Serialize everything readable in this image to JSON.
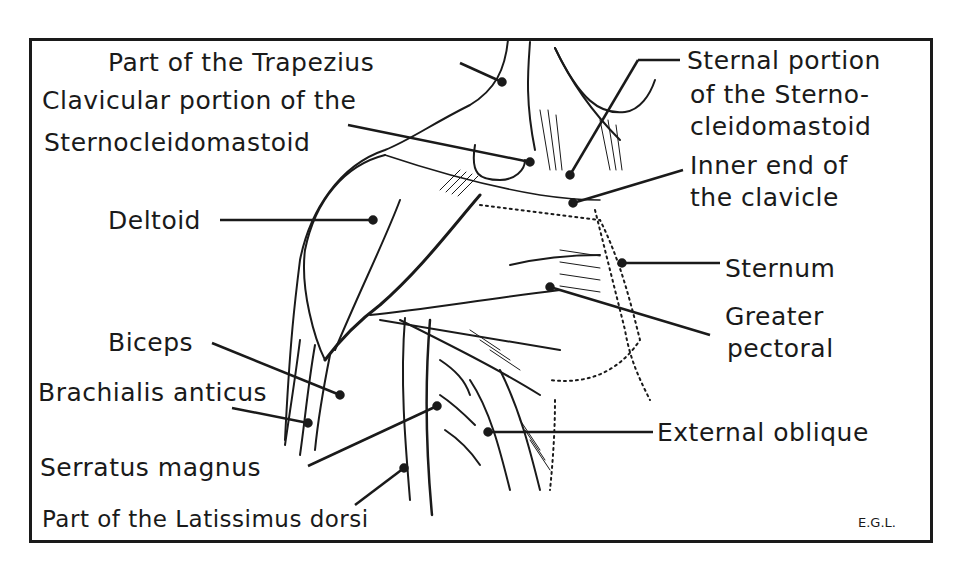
{
  "diagram": {
    "type": "anatomical-illustration",
    "labels": [
      {
        "id": "trapezius",
        "text": "Part of the Trapezius"
      },
      {
        "id": "clavicular-scm-line1",
        "text": "Clavicular portion of the"
      },
      {
        "id": "clavicular-scm-line2",
        "text": "Sternocleidomastoid"
      },
      {
        "id": "sternal-scm-line1",
        "text": "Sternal portion"
      },
      {
        "id": "sternal-scm-line2",
        "text": "of the Sterno-"
      },
      {
        "id": "sternal-scm-line3",
        "text": "cleidomastoid"
      },
      {
        "id": "inner-clavicle-line1",
        "text": "Inner end of"
      },
      {
        "id": "inner-clavicle-line2",
        "text": "the clavicle"
      },
      {
        "id": "deltoid",
        "text": "Deltoid"
      },
      {
        "id": "sternum",
        "text": "Sternum"
      },
      {
        "id": "greater-pectoral-line1",
        "text": "Greater"
      },
      {
        "id": "greater-pectoral-line2",
        "text": "pectoral"
      },
      {
        "id": "biceps",
        "text": "Biceps"
      },
      {
        "id": "brachialis",
        "text": "Brachialis anticus"
      },
      {
        "id": "serratus",
        "text": "Serratus magnus"
      },
      {
        "id": "external-oblique",
        "text": "External oblique"
      },
      {
        "id": "latissimus",
        "text": "Part of the Latissimus dorsi"
      }
    ],
    "signature": "E.G.L."
  },
  "colors": {
    "ink": "#1a1a1a",
    "paper": "#ffffff"
  }
}
